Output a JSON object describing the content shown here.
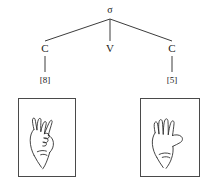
{
  "figure": {
    "type": "syllable-structure-tree",
    "caption": "",
    "root": {
      "label": "σ",
      "name": "syllable"
    },
    "skeleton_tier": [
      {
        "label": "C",
        "name": "consonant-left"
      },
      {
        "label": "V",
        "name": "vowel"
      },
      {
        "label": "C",
        "name": "consonant-right"
      }
    ],
    "features": [
      {
        "label": "[8]",
        "name": "handshape-8"
      },
      {
        "label": "[5]",
        "name": "handshape-5"
      }
    ],
    "illustrations": [
      {
        "name": "hand-8-handshape",
        "description": "line drawing of a hand in the 8 handshape, middle finger bent to thumb, other fingers extended"
      },
      {
        "name": "hand-5-handshape",
        "description": "line drawing of an open hand in the 5 handshape, all five fingers extended and spread"
      }
    ],
    "colors": {
      "ink": "#1a1a1a",
      "line": "#3c3c3c",
      "box_border": "#4a4a4a",
      "background": "#ffffff"
    }
  }
}
